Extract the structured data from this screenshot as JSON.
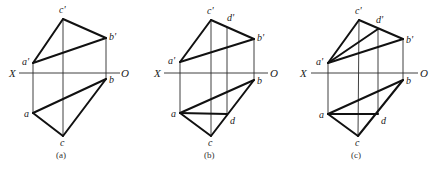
{
  "figures": [
    {
      "caption": "(a)",
      "axis": {
        "x_label": "X",
        "o_label": "O",
        "y": 73,
        "x1": 19,
        "x2": 120,
        "x_label_pos": [
          9,
          77
        ],
        "o_label_pos": [
          121,
          77
        ]
      },
      "points": {
        "a_prime": {
          "label": "a'",
          "x": 33,
          "y": 63,
          "lx": 22,
          "ly": 65
        },
        "b_prime": {
          "label": "b'",
          "x": 106,
          "y": 38,
          "lx": 109,
          "ly": 40
        },
        "c_prime": {
          "label": "c'",
          "x": 63,
          "y": 19,
          "lx": 59,
          "ly": 13
        },
        "a": {
          "label": "a",
          "x": 33,
          "y": 113,
          "lx": 24,
          "ly": 117
        },
        "b": {
          "label": "b",
          "x": 106,
          "y": 79,
          "lx": 109,
          "ly": 83
        },
        "c": {
          "label": "c",
          "x": 63,
          "y": 136,
          "lx": 60,
          "ly": 146
        }
      },
      "caption_pos": [
        56,
        158
      ]
    },
    {
      "caption": "(b)",
      "axis": {
        "x_label": "X",
        "o_label": "O",
        "y": 73,
        "x1": 164,
        "x2": 268,
        "x_label_pos": [
          154,
          77
        ],
        "o_label_pos": [
          270,
          77
        ]
      },
      "points": {
        "a_prime": {
          "label": "a'",
          "x": 180,
          "y": 62,
          "lx": 168,
          "ly": 64
        },
        "b_prime": {
          "label": "b'",
          "x": 254,
          "y": 39,
          "lx": 257,
          "ly": 41
        },
        "c_prime": {
          "label": "c'",
          "x": 211,
          "y": 20,
          "lx": 207,
          "ly": 14
        },
        "d_prime": {
          "label": "d'",
          "x": 227,
          "y": 27,
          "lx": 227,
          "ly": 21
        },
        "a": {
          "label": "a",
          "x": 180,
          "y": 113,
          "lx": 171,
          "ly": 117
        },
        "b": {
          "label": "b",
          "x": 254,
          "y": 80,
          "lx": 257,
          "ly": 84
        },
        "c": {
          "label": "c",
          "x": 211,
          "y": 136,
          "lx": 208,
          "ly": 146
        },
        "d": {
          "label": "d",
          "x": 227,
          "y": 114,
          "lx": 230,
          "ly": 124
        }
      },
      "caption_pos": [
        204,
        158
      ]
    },
    {
      "caption": "(c)",
      "axis": {
        "x_label": "X",
        "o_label": "O",
        "y": 73,
        "x1": 311,
        "x2": 418,
        "x_label_pos": [
          300,
          77
        ],
        "o_label_pos": [
          420,
          77
        ]
      },
      "points": {
        "a_prime": {
          "label": "a'",
          "x": 328,
          "y": 63,
          "lx": 316,
          "ly": 65
        },
        "b_prime": {
          "label": "b'",
          "x": 403,
          "y": 39,
          "lx": 406,
          "ly": 43
        },
        "c_prime": {
          "label": "c'",
          "x": 359,
          "y": 20,
          "lx": 355,
          "ly": 14
        },
        "d_prime": {
          "label": "d'",
          "x": 378,
          "y": 29,
          "lx": 376,
          "ly": 23
        },
        "a": {
          "label": "a",
          "x": 328,
          "y": 114,
          "lx": 319,
          "ly": 118
        },
        "b": {
          "label": "b",
          "x": 403,
          "y": 80,
          "lx": 406,
          "ly": 84
        },
        "c": {
          "label": "c",
          "x": 358,
          "y": 136,
          "lx": 355,
          "ly": 146
        },
        "d": {
          "label": "d",
          "x": 378,
          "y": 114,
          "lx": 381,
          "ly": 124
        }
      },
      "caption_pos": [
        351,
        158
      ]
    }
  ]
}
